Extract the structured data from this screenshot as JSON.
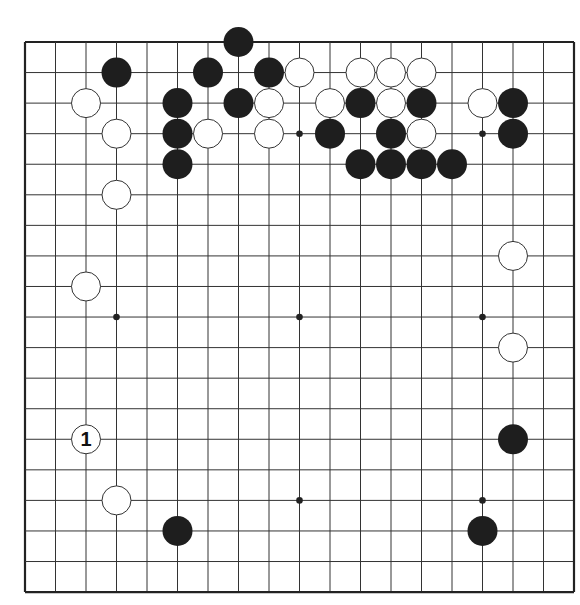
{
  "board": {
    "size": 19,
    "origin_x": 25,
    "origin_y": 42,
    "spacing_x": 30.5,
    "spacing_y": 30.56,
    "stone_radius": 15,
    "line_color": "#333333",
    "edge_color": "#222222",
    "black_color": "#1e1e1e",
    "white_fill": "#ffffff",
    "white_stroke": "#333333"
  },
  "star_points": [
    [
      3,
      3
    ],
    [
      9,
      3
    ],
    [
      15,
      3
    ],
    [
      3,
      9
    ],
    [
      9,
      9
    ],
    [
      15,
      9
    ],
    [
      3,
      15
    ],
    [
      9,
      15
    ],
    [
      15,
      15
    ]
  ],
  "stones": [
    {
      "color": "black",
      "col": 7,
      "row": 0
    },
    {
      "color": "black",
      "col": 3,
      "row": 1
    },
    {
      "color": "black",
      "col": 6,
      "row": 1
    },
    {
      "color": "black",
      "col": 8,
      "row": 1
    },
    {
      "color": "white",
      "col": 9,
      "row": 1
    },
    {
      "color": "white",
      "col": 11,
      "row": 1
    },
    {
      "color": "white",
      "col": 12,
      "row": 1
    },
    {
      "color": "white",
      "col": 13,
      "row": 1
    },
    {
      "color": "white",
      "col": 2,
      "row": 2
    },
    {
      "color": "black",
      "col": 5,
      "row": 2
    },
    {
      "color": "black",
      "col": 7,
      "row": 2
    },
    {
      "color": "white",
      "col": 8,
      "row": 2
    },
    {
      "color": "white",
      "col": 10,
      "row": 2
    },
    {
      "color": "black",
      "col": 11,
      "row": 2
    },
    {
      "color": "white",
      "col": 12,
      "row": 2
    },
    {
      "color": "black",
      "col": 13,
      "row": 2
    },
    {
      "color": "white",
      "col": 15,
      "row": 2
    },
    {
      "color": "black",
      "col": 16,
      "row": 2
    },
    {
      "color": "white",
      "col": 3,
      "row": 3
    },
    {
      "color": "black",
      "col": 5,
      "row": 3
    },
    {
      "color": "white",
      "col": 6,
      "row": 3
    },
    {
      "color": "white",
      "col": 8,
      "row": 3
    },
    {
      "color": "black",
      "col": 10,
      "row": 3
    },
    {
      "color": "black",
      "col": 12,
      "row": 3
    },
    {
      "color": "white",
      "col": 13,
      "row": 3
    },
    {
      "color": "black",
      "col": 16,
      "row": 3
    },
    {
      "color": "black",
      "col": 5,
      "row": 4
    },
    {
      "color": "black",
      "col": 11,
      "row": 4
    },
    {
      "color": "black",
      "col": 12,
      "row": 4
    },
    {
      "color": "black",
      "col": 13,
      "row": 4
    },
    {
      "color": "black",
      "col": 14,
      "row": 4
    },
    {
      "color": "white",
      "col": 3,
      "row": 5
    },
    {
      "color": "white",
      "col": 16,
      "row": 7
    },
    {
      "color": "white",
      "col": 2,
      "row": 8
    },
    {
      "color": "white",
      "col": 16,
      "row": 10
    },
    {
      "color": "white",
      "col": 2,
      "row": 13,
      "label": "1"
    },
    {
      "color": "black",
      "col": 16,
      "row": 13
    },
    {
      "color": "white",
      "col": 3,
      "row": 15
    },
    {
      "color": "black",
      "col": 5,
      "row": 16
    },
    {
      "color": "black",
      "col": 15,
      "row": 16
    }
  ]
}
